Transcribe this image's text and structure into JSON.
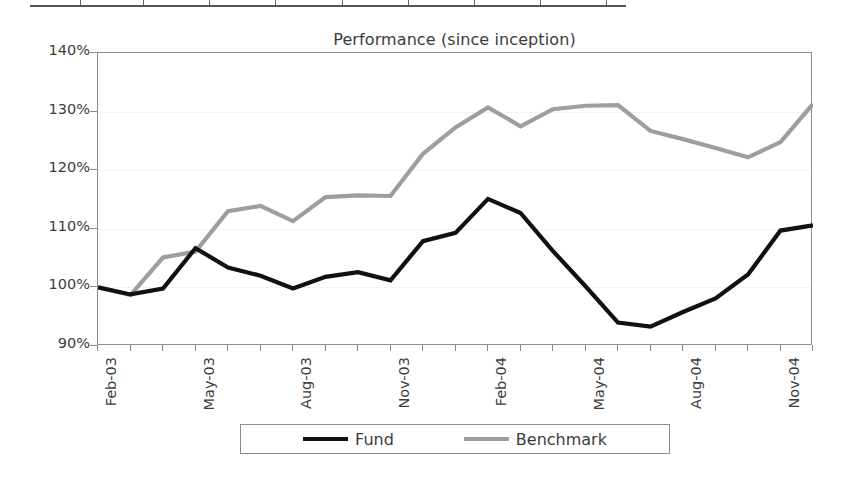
{
  "table_fragment": {
    "divider_positions": [
      50,
      113,
      179,
      245,
      312,
      378,
      444,
      510,
      576
    ]
  },
  "chart_data": {
    "type": "line",
    "title": "Performance (since inception)",
    "xlabel": "",
    "ylabel": "",
    "ylim": [
      90,
      140
    ],
    "ytick_values": [
      140,
      130,
      120,
      110,
      100,
      90
    ],
    "ytick_labels": [
      "140%",
      "130%",
      "120%",
      "110%",
      "100%",
      "90%"
    ],
    "grid": true,
    "legend_position": "bottom",
    "categories": [
      "Feb-03",
      "Mar-03",
      "Apr-03",
      "May-03",
      "Jun-03",
      "Jul-03",
      "Aug-03",
      "Sep-03",
      "Oct-03",
      "Nov-03",
      "Dec-03",
      "Jan-04",
      "Feb-04",
      "Mar-04",
      "Apr-04",
      "May-04",
      "Jun-04",
      "Jul-04",
      "Aug-04",
      "Sep-04",
      "Oct-04",
      "Nov-04",
      "Dec-04"
    ],
    "xtick_labels": [
      "Feb-03",
      "May-03",
      "Aug-03",
      "Nov-03",
      "Feb-04",
      "May-04",
      "Aug-04",
      "Nov-04"
    ],
    "xtick_indices": [
      0,
      3,
      6,
      9,
      12,
      15,
      18,
      21
    ],
    "series": [
      {
        "name": "Fund",
        "color": "#111111",
        "values": [
          100.0,
          98.8,
          99.8,
          106.7,
          103.4,
          102.0,
          99.8,
          101.8,
          102.6,
          101.2,
          107.9,
          109.3,
          115.1,
          112.7,
          106.2,
          100.2,
          94.0,
          93.3,
          95.8,
          98.1,
          102.2,
          109.7,
          110.6
        ]
      },
      {
        "name": "Benchmark",
        "color": "#9e9e9e",
        "values": [
          100.0,
          98.7,
          105.1,
          106.1,
          113.0,
          113.9,
          111.3,
          115.4,
          115.7,
          115.6,
          122.8,
          127.3,
          130.7,
          127.5,
          130.4,
          131.0,
          131.1,
          126.7,
          125.3,
          123.8,
          122.2,
          124.8,
          131.3
        ]
      }
    ]
  },
  "legend": {
    "items": [
      {
        "label": "Fund",
        "color": "#111111"
      },
      {
        "label": "Benchmark",
        "color": "#9e9e9e"
      }
    ]
  }
}
